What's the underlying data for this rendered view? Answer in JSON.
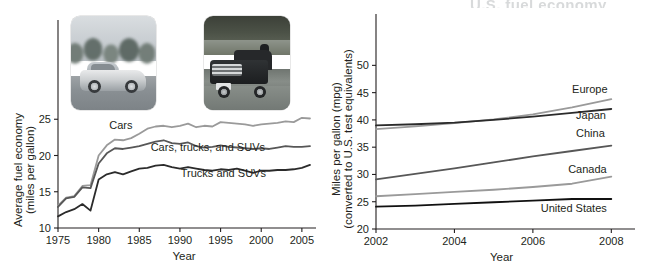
{
  "figure": {
    "header_fragment": "U.S. fuel economy"
  },
  "panels": [
    {
      "id": "left",
      "photos": [
        {
          "name": "photo-sedan",
          "alt": "silver passenger car on a tree-lined road"
        },
        {
          "name": "photo-pickup",
          "alt": "dark pickup truck on a highway"
        }
      ]
    },
    {
      "id": "right",
      "photos": [
        {
          "name": "photo-microcar",
          "alt": "small two-seat city car parked on a street"
        }
      ]
    }
  ],
  "chart_data": [
    {
      "type": "line",
      "id": "us-average-fuel-economy",
      "title": "",
      "xlabel": "Year",
      "ylabel": "Average fuel economy\n(miles per gallon)",
      "ylabel_line1": "Average fuel economy",
      "ylabel_line2": "(miles per gallon)",
      "xlim": [
        1975,
        2006
      ],
      "ylim": [
        10,
        26
      ],
      "xticks": [
        1975,
        1980,
        1985,
        1990,
        1995,
        2000,
        2005
      ],
      "xtick_labels": [
        "1975",
        "1980",
        "1985",
        "1990",
        "1995",
        "2000",
        "2005"
      ],
      "yticks": [
        10,
        15,
        20,
        25
      ],
      "ytick_labels": [
        "10",
        "15",
        "20",
        "25"
      ],
      "grid": false,
      "legend": "inline-labels",
      "x": [
        1975,
        1976,
        1977,
        1978,
        1979,
        1980,
        1981,
        1982,
        1983,
        1984,
        1985,
        1986,
        1987,
        1988,
        1989,
        1990,
        1991,
        1992,
        1993,
        1994,
        1995,
        1996,
        1997,
        1998,
        1999,
        2000,
        2001,
        2002,
        2003,
        2004,
        2005,
        2006
      ],
      "series": [
        {
          "name": "Cars",
          "color": "#9a9a9a",
          "label": "Cars",
          "label_x": 1981.3,
          "label_y": 23.6,
          "values": [
            13.1,
            14.2,
            14.4,
            15.8,
            15.9,
            20.0,
            21.4,
            22.2,
            22.1,
            22.4,
            23.0,
            23.7,
            24.0,
            24.1,
            23.9,
            24.1,
            24.4,
            23.9,
            24.1,
            24.0,
            24.6,
            24.5,
            24.4,
            24.3,
            24.1,
            24.3,
            24.4,
            24.5,
            24.7,
            24.6,
            25.2,
            25.1
          ]
        },
        {
          "name": "Cars, trucks, and SUVs",
          "color": "#575757",
          "label": "Cars, trucks, and SUVs",
          "label_x": 1986.4,
          "label_y": 20.6,
          "values": [
            12.9,
            14.1,
            14.3,
            15.6,
            15.5,
            18.9,
            20.3,
            21.0,
            20.9,
            21.1,
            21.3,
            21.6,
            21.9,
            22.1,
            21.7,
            21.6,
            21.8,
            21.3,
            21.1,
            21.2,
            21.4,
            21.2,
            21.1,
            21.0,
            20.9,
            21.0,
            20.9,
            21.1,
            21.3,
            21.2,
            21.2,
            21.3
          ]
        },
        {
          "name": "Trucks and SUVs",
          "color": "#2b2b2b",
          "label": "Trucks and SUVs",
          "label_x": 1990.1,
          "label_y": 17.1,
          "values": [
            11.6,
            12.2,
            12.6,
            13.3,
            12.4,
            16.7,
            17.4,
            17.7,
            17.4,
            17.8,
            18.2,
            18.3,
            18.6,
            18.7,
            18.4,
            18.2,
            18.4,
            18.2,
            18.0,
            17.9,
            18.1,
            18.0,
            18.2,
            17.9,
            17.6,
            17.9,
            17.9,
            18.0,
            18.0,
            18.1,
            18.3,
            18.7
          ]
        }
      ]
    },
    {
      "type": "line",
      "id": "international-fuel-economy-standards",
      "title": "",
      "xlabel": "Year",
      "ylabel": "Miles per gallon (mpg)\n(converted to U.S. test equivalents)",
      "ylabel_line1": "Miles per gallon (mpg)",
      "ylabel_line2": "(converted to U.S. test equivalents)",
      "xlim": [
        2002,
        2008.4
      ],
      "ylim": [
        20,
        53
      ],
      "xticks": [
        2002,
        2004,
        2006,
        2008
      ],
      "xtick_labels": [
        "2002",
        "2004",
        "2006",
        "2008"
      ],
      "yticks": [
        20,
        25,
        30,
        35,
        40,
        45,
        50
      ],
      "ytick_labels": [
        "20",
        "25",
        "30",
        "35",
        "40",
        "45",
        "50"
      ],
      "grid": false,
      "legend": "inline-labels",
      "x": [
        2002,
        2003,
        2004,
        2005,
        2006,
        2007,
        2008
      ],
      "series": [
        {
          "name": "Europe",
          "color": "#9a9a9a",
          "label": "Europe",
          "label_x": 2007.0,
          "label_y": 45.0,
          "values": [
            38.3,
            38.8,
            39.4,
            40.1,
            41.0,
            42.3,
            43.8
          ]
        },
        {
          "name": "Japan",
          "color": "#2b2b2b",
          "label": "Japan",
          "label_x": 2007.1,
          "label_y": 40.1,
          "values": [
            39.0,
            39.2,
            39.5,
            40.0,
            40.6,
            41.3,
            42.0
          ]
        },
        {
          "name": "China",
          "color": "#575757",
          "label": "China",
          "label_x": 2007.1,
          "label_y": 36.8,
          "values": [
            29.1,
            30.1,
            31.1,
            32.2,
            33.3,
            34.3,
            35.3
          ]
        },
        {
          "name": "Canada",
          "color": "#9a9a9a",
          "label": "Canada",
          "label_x": 2006.9,
          "label_y": 30.3,
          "values": [
            26.0,
            26.4,
            26.8,
            27.2,
            27.7,
            28.3,
            29.6
          ]
        },
        {
          "name": "United States",
          "color": "#111111",
          "label": "United States",
          "label_x": 2006.2,
          "label_y": 23.1,
          "values": [
            24.1,
            24.3,
            24.6,
            24.9,
            25.2,
            25.5,
            25.5
          ]
        }
      ]
    }
  ]
}
